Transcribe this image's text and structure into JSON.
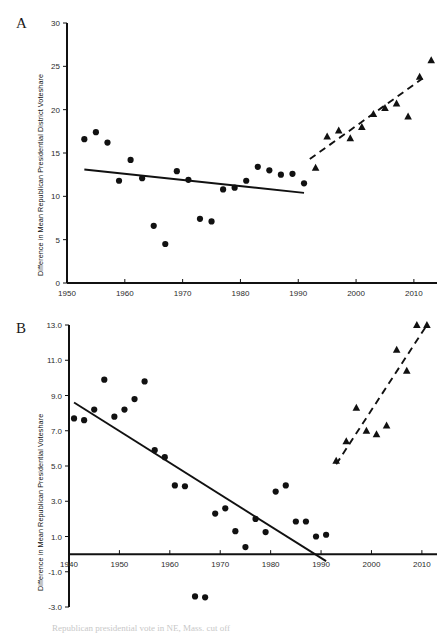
{
  "figure": {
    "panels": [
      {
        "letter": "A",
        "ylabel": "Difference in Mean Republican Presidential District Voteshare"
      },
      {
        "letter": "B",
        "ylabel": "Difference in Mean Republican Presidential Voteshare"
      }
    ],
    "bottom_caption_fragment": "Republican presidential vote in NE, Mass. cut off"
  },
  "chart_data": [
    {
      "panel": "A",
      "type": "scatter",
      "title": "",
      "xlabel": "",
      "ylabel": "Difference in Mean Republican Presidential District Voteshare",
      "xlim": [
        1950,
        2014
      ],
      "ylim": [
        0,
        30
      ],
      "xticks": [
        1950,
        1960,
        1970,
        1980,
        1990,
        2000,
        2010
      ],
      "yticks": [
        0,
        5,
        10,
        15,
        20,
        25,
        30
      ],
      "grid": false,
      "legend": "none",
      "series": [
        {
          "name": "Pre-redistricting era (circles)",
          "marker": "circle",
          "points": [
            [
              1953,
              16.6
            ],
            [
              1955,
              17.4
            ],
            [
              1957,
              16.2
            ],
            [
              1959,
              11.8
            ],
            [
              1961,
              14.2
            ],
            [
              1963,
              12.1
            ],
            [
              1965,
              6.6
            ],
            [
              1967,
              4.5
            ],
            [
              1969,
              12.9
            ],
            [
              1971,
              11.9
            ],
            [
              1973,
              7.4
            ],
            [
              1975,
              7.1
            ],
            [
              1977,
              10.8
            ],
            [
              1979,
              11.0
            ],
            [
              1981,
              11.8
            ],
            [
              1983,
              13.4
            ],
            [
              1985,
              13.0
            ],
            [
              1987,
              12.5
            ],
            [
              1989,
              12.6
            ],
            [
              1991,
              11.5
            ]
          ]
        },
        {
          "name": "Post-1992 era (triangles)",
          "marker": "triangle",
          "points": [
            [
              1993,
              13.3
            ],
            [
              1995,
              16.9
            ],
            [
              1997,
              17.6
            ],
            [
              1999,
              16.7
            ],
            [
              2001,
              18.0
            ],
            [
              2003,
              19.5
            ],
            [
              2005,
              20.2
            ],
            [
              2007,
              20.7
            ],
            [
              2009,
              19.2
            ],
            [
              2011,
              23.8
            ],
            [
              2013,
              25.7
            ]
          ]
        }
      ],
      "trendlines": [
        {
          "name": "solid-trend-circles",
          "style": "solid",
          "x0": 1953,
          "y0": 13.1,
          "x1": 1991,
          "y1": 10.4
        },
        {
          "name": "dashed-trend-triangles",
          "style": "dashed",
          "x0": 1992,
          "y0": 14.3,
          "x1": 2011.5,
          "y1": 23.6
        }
      ]
    },
    {
      "panel": "B",
      "type": "scatter",
      "title": "",
      "xlabel": "",
      "ylabel": "Difference in Mean Republican Presidential Voteshare",
      "xlim": [
        1940,
        2013
      ],
      "ylim": [
        -3.0,
        13.0
      ],
      "xticks": [
        1940,
        1950,
        1960,
        1970,
        1980,
        1990,
        2000,
        2010
      ],
      "yticks": [
        -3.0,
        -1.0,
        1.0,
        3.0,
        5.0,
        7.0,
        9.0,
        11.0,
        13.0
      ],
      "grid": false,
      "legend": "none",
      "series": [
        {
          "name": "Pre-redistricting era (circles)",
          "marker": "circle",
          "points": [
            [
              1941,
              7.7
            ],
            [
              1943,
              7.6
            ],
            [
              1945,
              8.2
            ],
            [
              1947,
              9.9
            ],
            [
              1949,
              7.8
            ],
            [
              1951,
              8.2
            ],
            [
              1953,
              8.8
            ],
            [
              1955,
              9.8
            ],
            [
              1957,
              5.9
            ],
            [
              1959,
              5.5
            ],
            [
              1961,
              3.9
            ],
            [
              1963,
              3.85
            ],
            [
              1965,
              -2.4
            ],
            [
              1967,
              -2.45
            ],
            [
              1969,
              2.3
            ],
            [
              1971,
              2.6
            ],
            [
              1973,
              1.3
            ],
            [
              1975,
              0.4
            ],
            [
              1977,
              2.0
            ],
            [
              1979,
              1.25
            ],
            [
              1981,
              3.55
            ],
            [
              1983,
              3.9
            ],
            [
              1985,
              1.85
            ],
            [
              1987,
              1.85
            ],
            [
              1989,
              1.0
            ],
            [
              1991,
              1.1
            ]
          ]
        },
        {
          "name": "Post-1992 era (triangles)",
          "marker": "triangle",
          "points": [
            [
              1993,
              5.3
            ],
            [
              1995,
              6.4
            ],
            [
              1997,
              8.3
            ],
            [
              1999,
              7.0
            ],
            [
              2001,
              6.8
            ],
            [
              2003,
              7.3
            ],
            [
              2005,
              11.6
            ],
            [
              2007,
              10.4
            ],
            [
              2009,
              13.0
            ],
            [
              2011,
              13.0
            ]
          ]
        }
      ],
      "trendlines": [
        {
          "name": "solid-trend-circles",
          "style": "solid",
          "x0": 1941,
          "y0": 8.6,
          "x1": 1991,
          "y1": -0.4
        },
        {
          "name": "dashed-trend-triangles",
          "style": "dashed",
          "x0": 1993,
          "y0": 5.1,
          "x1": 2011,
          "y1": 13.0
        }
      ]
    }
  ]
}
